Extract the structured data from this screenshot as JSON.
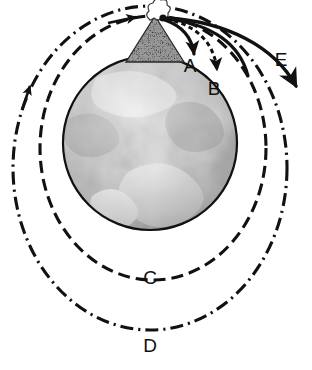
{
  "figure": {
    "background_color": "#ffffff",
    "ink_color": "#111111",
    "width": 312,
    "height": 370
  },
  "earth": {
    "name": "earth-globe",
    "center_x": 150,
    "center_y": 143,
    "radius": 88,
    "outline_color": "#111111",
    "description": "Grayscale satellite photograph of Earth with clouds and continents"
  },
  "mountain": {
    "name": "launch-mountain",
    "peak_x": 155,
    "peak_y": 16,
    "base_left_x": 128,
    "base_right_x": 182,
    "base_y": 58,
    "fill_color": "#3a3a3a",
    "description": "Tall stippled mountain with a cannon firing a puff of smoke at its summit"
  },
  "cannonball": {
    "name": "cannonball-dot",
    "x": 163,
    "y": 18,
    "radius": 3.4,
    "color": "#111111"
  },
  "smoke_puff": {
    "name": "smoke-puff",
    "x": 150,
    "y": 18,
    "color": "#555555"
  },
  "trajectories": [
    {
      "id": "A",
      "name": "trajectory-a",
      "label": "A",
      "label_x": 190,
      "label_y": 68,
      "style": "solid",
      "arrowhead": true,
      "description": "Shortest cannonball flight, falls back to Earth close to the mountain"
    },
    {
      "id": "B",
      "name": "trajectory-b",
      "label": "B",
      "label_x": 214,
      "label_y": 91,
      "style": "dashed",
      "arrowhead": true,
      "description": "Longer cannonball flight, lands farther around the globe"
    },
    {
      "id": "C",
      "name": "orbit-c",
      "label": "C",
      "label_x": 150,
      "label_y": 284,
      "style": "dashed",
      "arrowhead": true,
      "description": "Closed circular orbit just above the Earth's surface"
    },
    {
      "id": "D",
      "name": "orbit-d",
      "label": "D",
      "label_x": 150,
      "label_y": 352,
      "style": "dash-dot",
      "arrowhead": true,
      "description": "Larger closed circular orbit around the Earth"
    },
    {
      "id": "E",
      "name": "escape-trajectory-e",
      "label": "E",
      "label_x": 281,
      "label_y": 60,
      "style": "solid",
      "arrowhead": true,
      "description": "Escape trajectory leaving the Earth entirely toward lower right"
    }
  ],
  "labels": {
    "a": "A",
    "b": "B",
    "c": "C",
    "d": "D",
    "e": "E"
  }
}
